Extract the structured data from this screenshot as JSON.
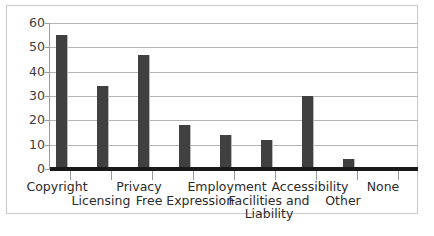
{
  "chart_data": {
    "type": "bar",
    "title": "",
    "xlabel": "",
    "ylabel": "",
    "categories": [
      "Copyright",
      "Licensing",
      "Privacy",
      "Free Expression",
      "Employment",
      "Facilities and Liability",
      "Accessibility",
      "Other",
      "None"
    ],
    "values": [
      55,
      34,
      47,
      18,
      14,
      12,
      30,
      4,
      0
    ],
    "ylim": [
      0,
      60
    ],
    "yticks": [
      0,
      10,
      20,
      30,
      40,
      50,
      60
    ],
    "ytick_labels": [
      "0",
      "10",
      "20",
      "30",
      "40",
      "50",
      "60"
    ],
    "grid": true,
    "legend": false,
    "bar_color": "#404040",
    "gridline_color": "#b5b5b5",
    "axis_color": "#1a1a1a",
    "background": "#ffffff",
    "border_color": "#c9c9c9"
  },
  "axis": {
    "y_tick_0": "0",
    "y_tick_1": "10",
    "y_tick_2": "20",
    "y_tick_3": "30",
    "y_tick_4": "40",
    "y_tick_5": "50",
    "y_tick_6": "60"
  },
  "labels": {
    "cat_0": "Copyright",
    "cat_1": "Licensing",
    "cat_2": "Privacy",
    "cat_3": "Free Expression",
    "cat_4": "Employment",
    "cat_5_line1": "Facilities and",
    "cat_5_line2": "Liability",
    "cat_6": "Accessibility",
    "cat_7": "Other",
    "cat_8": "None"
  }
}
